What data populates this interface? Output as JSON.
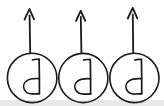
{
  "figure": {
    "title": "Three circled handwritten d glyphs each with an upward arrow",
    "canvas": {
      "width": 164,
      "height": 106
    },
    "style": {
      "background_color": "#fefefe",
      "ink_color": "#1a1a1a",
      "bottom_band_color": "#e8e8e8",
      "stroke_width": 1.6
    },
    "unit_count": 3,
    "units": [
      {
        "index": 1,
        "label": "unit-1",
        "circle": {
          "cx": 32,
          "cy": 78,
          "rx": 25,
          "ry": 25
        },
        "glyph": {
          "name": "handwritten-d",
          "character": "d",
          "x": 32,
          "y": 78
        },
        "arrow": {
          "direction": "up",
          "x": 30,
          "tail_y": 52,
          "tip_y": 9,
          "head_width": 9,
          "head_length": 10
        }
      },
      {
        "index": 2,
        "label": "unit-2",
        "circle": {
          "cx": 83,
          "cy": 78,
          "rx": 25,
          "ry": 25
        },
        "glyph": {
          "name": "handwritten-d",
          "character": "d",
          "x": 83,
          "y": 78
        },
        "arrow": {
          "direction": "up",
          "x": 81,
          "tail_y": 52,
          "tip_y": 11,
          "head_width": 9,
          "head_length": 10
        }
      },
      {
        "index": 3,
        "label": "unit-3",
        "circle": {
          "cx": 134,
          "cy": 78,
          "rx": 25,
          "ry": 25
        },
        "glyph": {
          "name": "handwritten-d",
          "character": "d",
          "x": 134,
          "y": 78
        },
        "arrow": {
          "direction": "up",
          "x": 133,
          "tail_y": 52,
          "tip_y": 8,
          "head_width": 9,
          "head_length": 10
        }
      }
    ]
  }
}
